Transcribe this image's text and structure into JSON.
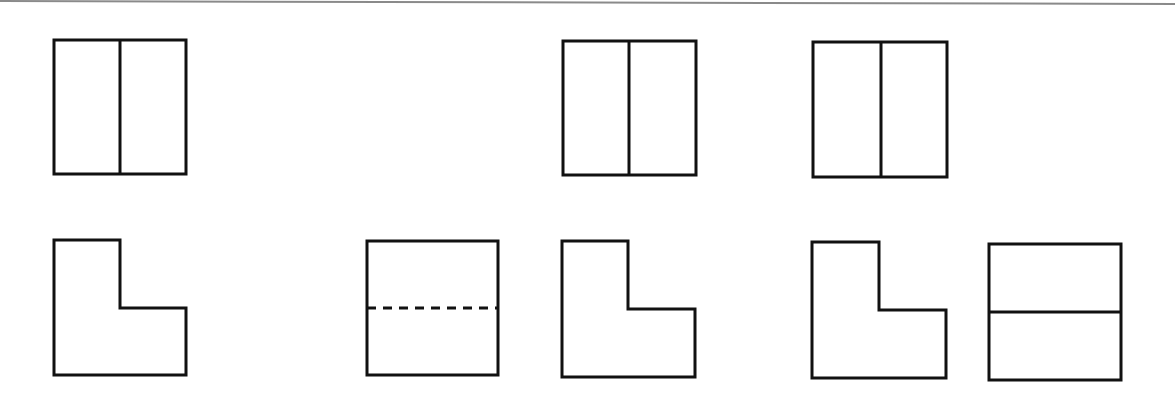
{
  "diagram": {
    "type": "three-view projection figure",
    "stroke_color": "#111111",
    "background": "#ffffff",
    "top_edge_line": {
      "x1": 0,
      "y1": 1,
      "x2": 1175,
      "y2": 4,
      "color": "#8a8a8a"
    },
    "rows": [
      {
        "name": "top-row",
        "figures": [
          {
            "id": "r1-f1",
            "kind": "rect-vertical-split",
            "x": 54,
            "y": 40,
            "w": 132,
            "h": 134,
            "divider": {
              "orientation": "vertical",
              "pos": 120,
              "style": "solid"
            }
          },
          {
            "id": "r1-f2",
            "kind": "empty-slot"
          },
          {
            "id": "r1-f3",
            "kind": "rect-vertical-split",
            "x": 563,
            "y": 41,
            "w": 133,
            "h": 134,
            "divider": {
              "orientation": "vertical",
              "pos": 629,
              "style": "solid"
            }
          },
          {
            "id": "r1-f4",
            "kind": "rect-vertical-split",
            "x": 813,
            "y": 42,
            "w": 134,
            "h": 135,
            "divider": {
              "orientation": "vertical",
              "pos": 881,
              "style": "solid"
            }
          }
        ]
      },
      {
        "name": "bottom-row",
        "figures": [
          {
            "id": "r2-f1",
            "kind": "l-shape",
            "x": 54,
            "y": 240,
            "w": 132,
            "h": 135,
            "notch": {
              "x": 120,
              "y": 308
            }
          },
          {
            "id": "r2-f2",
            "kind": "rect-horizontal-split",
            "x": 367,
            "y": 241,
            "w": 131,
            "h": 134,
            "divider": {
              "orientation": "horizontal",
              "pos": 308,
              "style": "dashed"
            }
          },
          {
            "id": "r2-f3",
            "kind": "l-shape",
            "x": 562,
            "y": 241,
            "w": 133,
            "h": 136,
            "notch": {
              "x": 628,
              "y": 309
            }
          },
          {
            "id": "r2-f4",
            "kind": "l-shape",
            "x": 812,
            "y": 242,
            "w": 134,
            "h": 136,
            "notch": {
              "x": 879,
              "y": 310
            }
          },
          {
            "id": "r2-f5",
            "kind": "rect-horizontal-split",
            "x": 989,
            "y": 244,
            "w": 132,
            "h": 136,
            "divider": {
              "orientation": "horizontal",
              "pos": 312,
              "style": "solid"
            }
          }
        ]
      }
    ]
  }
}
